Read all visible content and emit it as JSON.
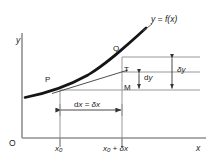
{
  "figure": {
    "background_color": "#ffffff",
    "axis_color": "#808080",
    "curve_color": "#1a1a1a",
    "line_color": "#555555",
    "text_color": "#1a1a1a"
  },
  "axes": {
    "origin_label": "O",
    "y_label": "y",
    "x_label": "x",
    "x_ticks": [
      {
        "label_plain": "x0",
        "label_base": "x",
        "label_sub": "0",
        "label_suffix": ""
      },
      {
        "label_plain": "x0 + δx",
        "label_base": "x",
        "label_sub": "0",
        "label_suffix": " + δx"
      }
    ]
  },
  "curve": {
    "function_label": "y = f(x)",
    "function_label_lhs": "y",
    "function_label_eq": " = ",
    "function_label_rhs": "f(x)"
  },
  "points": [
    {
      "name": "P",
      "label": "P"
    },
    {
      "name": "Q",
      "label": "Q"
    },
    {
      "name": "T",
      "label": "T"
    },
    {
      "name": "M",
      "label": "M"
    }
  ],
  "dimensions": {
    "horizontal": {
      "label": "dx = δx",
      "label_d": "d",
      "label_x": "x",
      "label_eq": " = ",
      "label_delta": "δx"
    },
    "dy": {
      "label": "dy",
      "label_d": "d",
      "label_var": "y"
    },
    "delta_y": {
      "label": "δy",
      "label_delta": "δ",
      "label_var": "y"
    }
  }
}
